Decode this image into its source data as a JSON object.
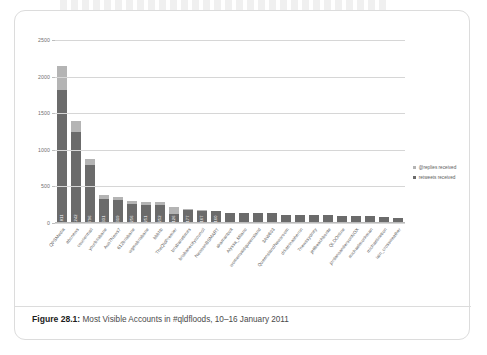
{
  "figure": {
    "caption_label": "Figure 28.1:",
    "caption_text": " Most Visible Accounts in #qldfloods, 10–16 January 2011"
  },
  "legend": {
    "position": "right",
    "items": [
      {
        "label": "@replies received",
        "color": "#b4b4b4",
        "swatch": "replies"
      },
      {
        "label": "retweets received",
        "color": "#6b6b6b",
        "swatch": "retweets"
      }
    ]
  },
  "colors": {
    "replies": "#b4b4b4",
    "retweets": "#6b6b6b",
    "gridline": "#d6d6d6",
    "axis_text": "#6f6f6f",
    "card_border": "#dcdcdc"
  },
  "chart_data": {
    "type": "bar",
    "subtype": "stacked-vertical",
    "title": "Most Visible Accounts in #qldfloods, 10–16 January 2011",
    "xlabel": "",
    "ylabel": "",
    "ylim": [
      0,
      2500
    ],
    "yticks": [
      0,
      500,
      1000,
      1500,
      2000,
      2500
    ],
    "ytick_labels": [
      "0",
      "500",
      "1000",
      "1500",
      "2000",
      "2500"
    ],
    "grid": true,
    "legend_position": "right",
    "categories": [
      "QPSMedia",
      "abcnews",
      "couriermail",
      "yourbrisbane",
      "Aus7News7",
      "612brisbane",
      "wgmobrisbane",
      "bbbhb",
      "TheQldPremier",
      "brisbanetimes",
      "brisbanecitycouncil",
      "NewsonBSMART",
      "akamanbolt",
      "Alyssa_Milano",
      "womensaidqueensland",
      "3AW693",
      "QueenslandNewsroom",
      "drkatrinasherrin",
      "7newssydney",
      "jettbeachbonte",
      "QLDOnline",
      "jordansandersonNOX",
      "michaelmonkman",
      "michaelinetion",
      "iain_crossweather"
    ],
    "series": [
      {
        "name": "retweets received",
        "color": "#6b6b6b",
        "values": [
          1811,
          1242,
          796,
          331,
          319,
          256,
          251,
          252,
          126,
          177,
          167,
          160,
          140,
          140,
          138,
          132,
          116,
          112,
          108,
          104,
          102,
          98,
          92,
          86,
          74
        ]
      },
      {
        "name": "@replies received",
        "color": "#b4b4b4",
        "values": [
          339,
          148,
          84,
          51,
          36,
          45,
          34,
          37,
          89,
          9,
          10,
          8,
          0,
          0,
          0,
          0,
          0,
          0,
          0,
          0,
          0,
          0,
          0,
          0,
          0
        ]
      }
    ],
    "bar_value_labels": [
      "1811",
      "1242",
      "796",
      "331",
      "319",
      "256",
      "251",
      "252",
      "126",
      "177",
      "167",
      "160",
      "",
      "",
      "",
      "",
      "",
      "",
      "",
      "",
      "",
      "",
      "",
      "",
      ""
    ],
    "totals": [
      2150,
      1390,
      880,
      382,
      355,
      301,
      285,
      289,
      215,
      186,
      177,
      168,
      140,
      140,
      138,
      132,
      116,
      112,
      108,
      104,
      102,
      98,
      92,
      86,
      74
    ]
  }
}
